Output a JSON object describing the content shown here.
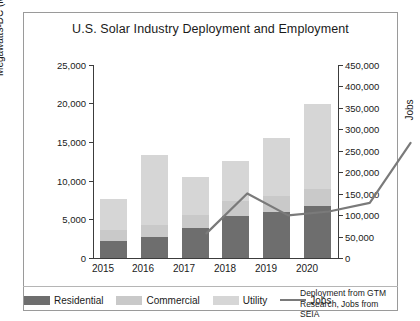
{
  "chart_data": {
    "type": "bar",
    "title": "U.S. Solar Industry Deployment and Employment",
    "xlabel": "",
    "ylabel": "Megawatts-DC (MWdc)",
    "y2label": "Jobs",
    "categories": [
      "2015",
      "2016",
      "2017",
      "2018",
      "2019",
      "2020"
    ],
    "ylim": [
      0,
      25000
    ],
    "y2lim": [
      0,
      450000
    ],
    "yticks": [
      "0",
      "5,000",
      "10,000",
      "15,000",
      "20,000",
      "25,000"
    ],
    "y2ticks": [
      "0",
      "50,000",
      "100,000",
      "150,000",
      "200,000",
      "250,000",
      "300,000",
      "350,000",
      "400,000",
      "450,000"
    ],
    "grid": false,
    "legend_position": "bottom",
    "stacked": true,
    "series": [
      {
        "name": "Residential",
        "color": "#6e6e6e",
        "values": [
          2200,
          2700,
          3900,
          5500,
          6000,
          6700
        ]
      },
      {
        "name": "Commercial",
        "color": "#c9c9c9",
        "values": [
          1400,
          1600,
          1700,
          1900,
          2000,
          2200
        ]
      },
      {
        "name": "Utility",
        "color": "#d6d6d6",
        "values": [
          4000,
          9000,
          4900,
          5200,
          7500,
          11100
        ]
      }
    ],
    "totals": [
      7600,
      13300,
      10500,
      12600,
      15500,
      20000
    ],
    "line_series": {
      "name": "Jobs",
      "color": "#7a7a7a",
      "values": [
        209000,
        302000,
        251000,
        260000,
        280000,
        420000
      ]
    },
    "annotation": "Deployment from GTM Research, Jobs from SEIA",
    "legend": [
      {
        "label": "Residential",
        "type": "swatch",
        "color": "#6e6e6e"
      },
      {
        "label": "Commercial",
        "type": "swatch",
        "color": "#c9c9c9"
      },
      {
        "label": "Utility",
        "type": "swatch",
        "color": "#d6d6d6"
      },
      {
        "label": "Jobs",
        "type": "line",
        "color": "#7a7a7a"
      }
    ]
  }
}
